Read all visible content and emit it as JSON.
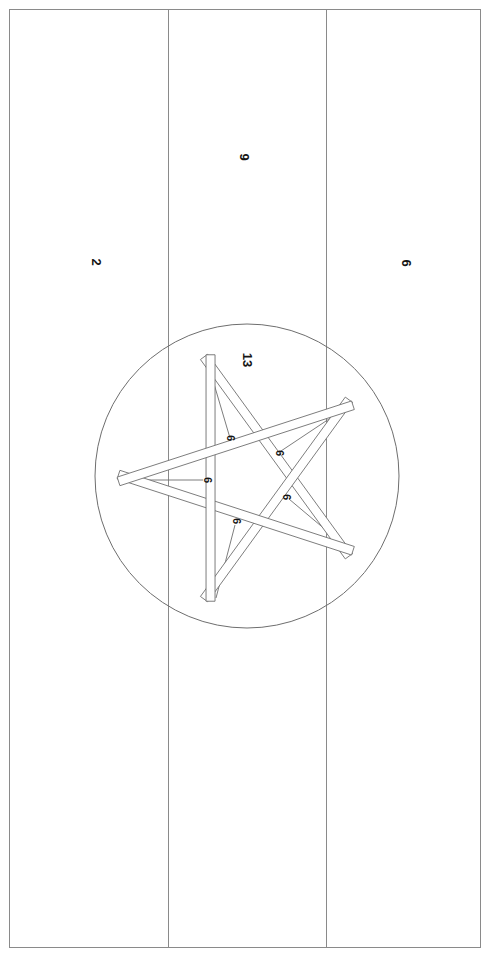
{
  "drawing": {
    "sheet": {
      "width": 488,
      "height": 956,
      "background_color": "#ffffff",
      "border_color": "#8a8a8a",
      "line_color": "#6e6e6e",
      "text_color": "#151515"
    },
    "frame": {
      "name": "outer-border",
      "x": 9,
      "y": 9,
      "width": 471,
      "height": 938
    },
    "panels": [
      {
        "id": "panel-left",
        "label": "2",
        "label_x": 96,
        "label_y": 262,
        "x": 9,
        "width": 159
      },
      {
        "id": "panel-center",
        "label": "9",
        "label_x": 244,
        "label_y": 157,
        "x": 168,
        "width": 158
      },
      {
        "id": "panel-right",
        "label": "6",
        "label_x": 406,
        "label_y": 263,
        "x": 326,
        "width": 154
      }
    ],
    "dividers": [
      {
        "id": "divider-1",
        "x": 168
      },
      {
        "id": "divider-2",
        "x": 326
      }
    ],
    "circle": {
      "id": "detail-circle",
      "cx": 247,
      "cy": 476,
      "r": 152,
      "label": "13",
      "label_x": 247,
      "label_y": 360
    },
    "star": {
      "id": "pentagram-star",
      "cx": 247,
      "cy": 478,
      "outer_r": 118,
      "strip_width": 9,
      "rotation_deg": -18,
      "points": 5,
      "strip_count": 5
    },
    "part_labels": [
      {
        "id": "part-label-1",
        "label": "6",
        "x": 230,
        "y": 438
      },
      {
        "id": "part-label-2",
        "label": "6",
        "x": 279,
        "y": 453
      },
      {
        "id": "part-label-3",
        "label": "6",
        "x": 207,
        "y": 480
      },
      {
        "id": "part-label-4",
        "label": "6",
        "x": 286,
        "y": 497
      },
      {
        "id": "part-label-5",
        "label": "6",
        "x": 236,
        "y": 521
      }
    ],
    "leader_lines": [
      {
        "id": "leader-line-1",
        "x1": 230,
        "y1": 438,
        "x2": 209,
        "y2": 367
      },
      {
        "id": "leader-line-2",
        "x1": 281,
        "y1": 451,
        "x2": 347,
        "y2": 407
      },
      {
        "id": "leader-line-3",
        "x1": 203,
        "y1": 480,
        "x2": 118,
        "y2": 480
      },
      {
        "id": "leader-line-4",
        "x1": 289,
        "y1": 499,
        "x2": 352,
        "y2": 552
      },
      {
        "id": "leader-line-5",
        "x1": 235,
        "y1": 525,
        "x2": 216,
        "y2": 598
      }
    ]
  }
}
